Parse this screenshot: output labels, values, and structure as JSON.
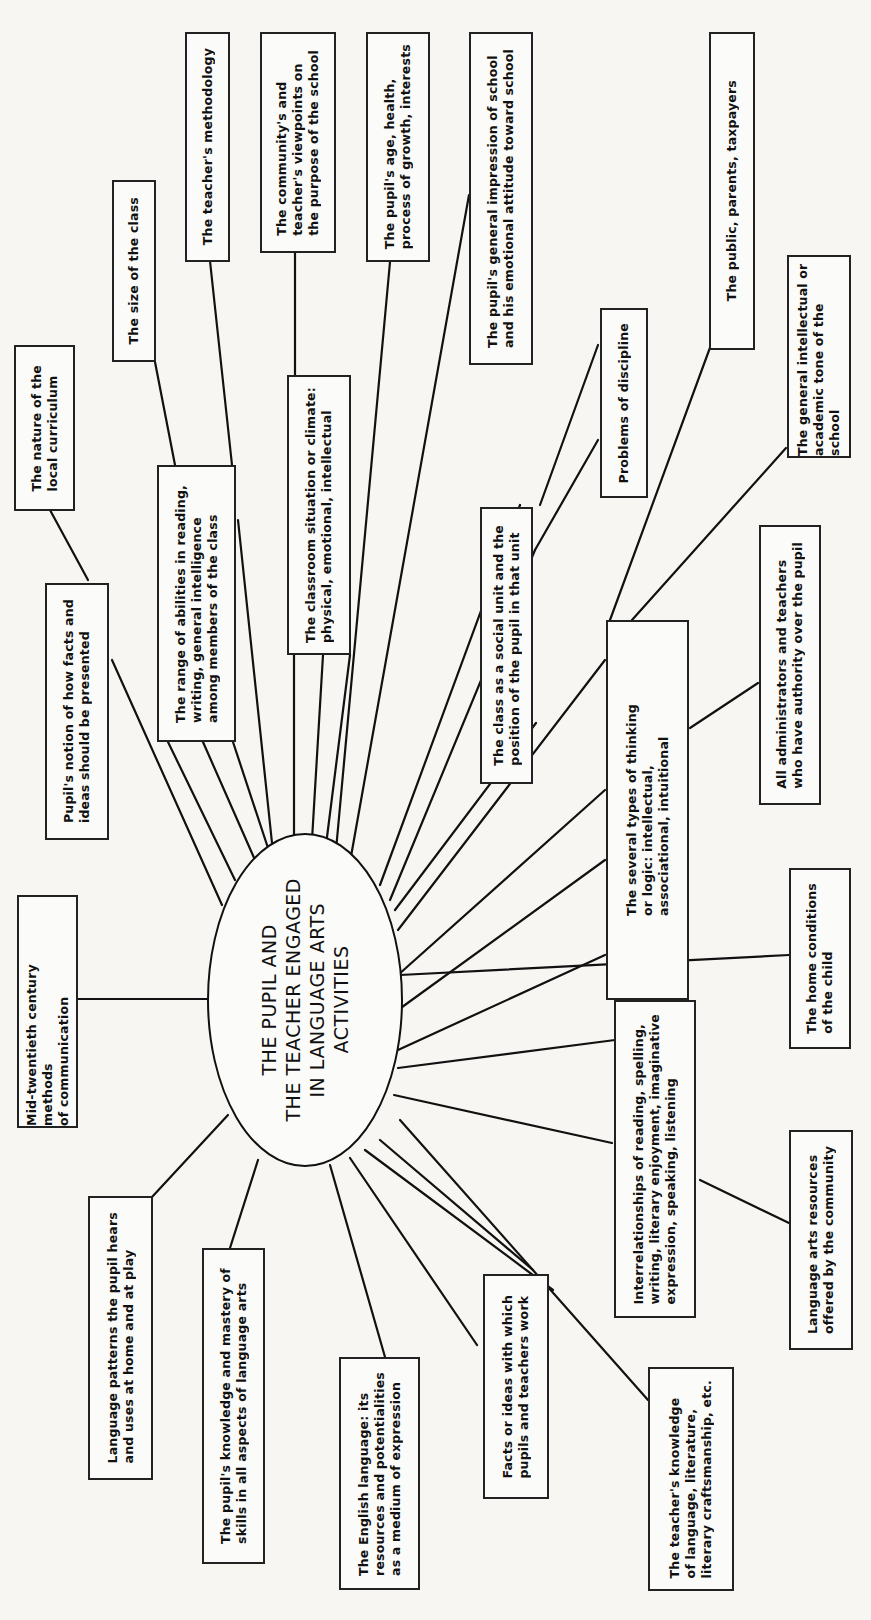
{
  "page": {
    "background_color": "#f7f6f3",
    "line_color": "#111111",
    "orientation": "rotated 90 degrees counter-clockwise"
  },
  "diagram": {
    "center": {
      "label": "THE PUPIL AND\nTHE TEACHER ENGAGED\nIN LANGUAGE ARTS\nACTIVITIES"
    },
    "nodes": [
      {
        "id": "local-curriculum",
        "label": "The nature of the\nlocal curriculum"
      },
      {
        "id": "size-of-class",
        "label": "The size of the class"
      },
      {
        "id": "teacher-methodology",
        "label": "The teacher's methodology"
      },
      {
        "id": "community-viewpoints",
        "label": "The community's and\nteacher's viewpoints on\nthe purpose of the school"
      },
      {
        "id": "pupil-age-health",
        "label": "The pupil's age, health,\nprocess of growth, interests"
      },
      {
        "id": "pupil-impression",
        "label": "The pupil's general impression of school\nand his emotional attitude toward school"
      },
      {
        "id": "public-parents",
        "label": "The public, parents, taxpayers"
      },
      {
        "id": "problems-discipline",
        "label": "Problems of discipline"
      },
      {
        "id": "intellectual-tone",
        "label": "The general intellectual or\nacademic tone of the school"
      },
      {
        "id": "pupil-notion",
        "label": "Pupil's notion of how facts and\nideas should be presented"
      },
      {
        "id": "range-abilities",
        "label": "The range of abilities in reading,\nwriting, general intelligence\namong members of the class"
      },
      {
        "id": "classroom-situation",
        "label": "The classroom situation or climate:\nphysical, emotional, intellectual"
      },
      {
        "id": "class-social-unit",
        "label": "The class as a social unit and the\nposition of the pupil in that unit"
      },
      {
        "id": "types-thinking",
        "label": "The several types of thinking\nor logic: intellectual,\nassociational, intuitional"
      },
      {
        "id": "administrators",
        "label": "All administrators and teachers\nwho have authority over the pupil"
      },
      {
        "id": "mid-twentieth",
        "label": "Mid-twentieth century methods\nof communication"
      },
      {
        "id": "home-conditions",
        "label": "The home conditions\nof the child"
      },
      {
        "id": "interrelationships",
        "label": "Interrelationships of reading, spelling,\nwriting, literary enjoyment, imaginative\nexpression, speaking, listening"
      },
      {
        "id": "community-resources",
        "label": "Language arts resources\noffered by the community"
      },
      {
        "id": "language-patterns",
        "label": "Language patterns the pupil hears\nand uses at home and at play"
      },
      {
        "id": "pupil-knowledge",
        "label": "The pupil's knowledge and mastery of\nskills in all aspects of language arts"
      },
      {
        "id": "english-language",
        "label": "The English language: its\nresources and potentialities\nas a medium of expression"
      },
      {
        "id": "facts-ideas",
        "label": "Facts or ideas with which\npupils and teachers work"
      },
      {
        "id": "teacher-knowledge",
        "label": "The teacher's knowledge\nof language, literature,\nliterary craftsmanship, etc."
      }
    ]
  }
}
